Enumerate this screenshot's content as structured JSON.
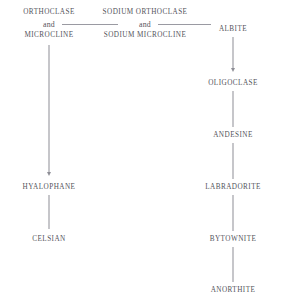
{
  "diagram": {
    "colors": {
      "background": "#ffffff",
      "text": "#53535b",
      "line": "#8e8e96"
    },
    "groups": [
      {
        "id": "potassium-feldspar-group",
        "top_label": "ORTHOCLASE",
        "conjunction": "and",
        "bottom_label": "MICROCLINE"
      },
      {
        "id": "sodium-potassium-feldspar-group",
        "top_label": "SODIUM ORTHOCLASE",
        "conjunction": "and",
        "bottom_label": "SODIUM MICROCLINE"
      }
    ],
    "nodes": [
      {
        "id": "albite",
        "label": "ALBITE"
      },
      {
        "id": "oligoclase",
        "label": "OLIGOCLASE"
      },
      {
        "id": "andesine",
        "label": "ANDESINE"
      },
      {
        "id": "labradorite",
        "label": "LABRADORITE"
      },
      {
        "id": "bytownite",
        "label": "BYTOWNITE"
      },
      {
        "id": "anorthite",
        "label": "ANORTHITE"
      },
      {
        "id": "hyalophane",
        "label": "HYALOPHANE"
      },
      {
        "id": "celsian",
        "label": "CELSIAN"
      }
    ]
  }
}
